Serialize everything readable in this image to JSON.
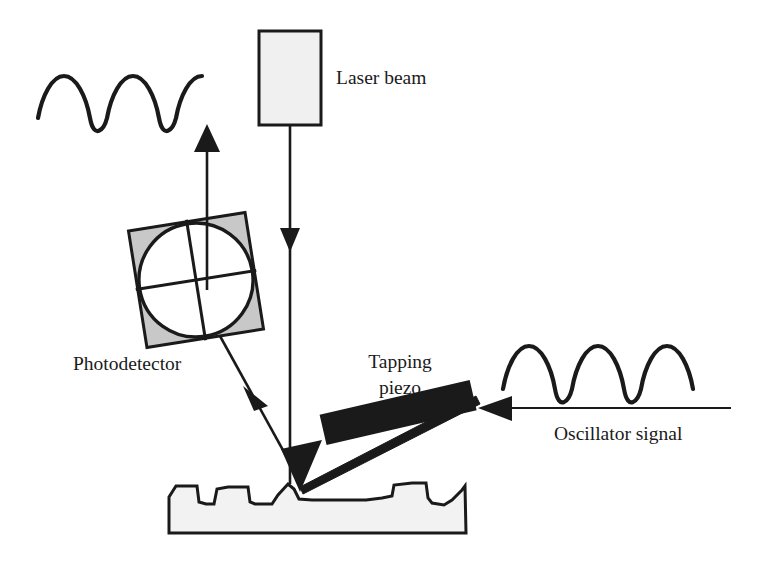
{
  "figure": {
    "background_color": "#ffffff",
    "ink_color": "#1a1a1a",
    "gray_fill": "#c8c8c8",
    "light_fill": "#f0f0f0",
    "sample_fill": "#f2f2f2"
  },
  "labels": {
    "laser_beam": "Laser beam",
    "photodetector": "Photodetector",
    "tapping_piezo_line1": "Tapping",
    "tapping_piezo_line2": "piezo",
    "oscillator_signal": "Oscillator signal"
  },
  "components": {
    "laser_box": {
      "name": "Laser beam source box",
      "x": 259,
      "y": 31,
      "width": 62,
      "height": 94,
      "fill": "#f0f0f0",
      "stroke": "#1a1a1a"
    },
    "photodetector": {
      "name": "Quadrant photodetector",
      "center_x": 196,
      "center_y": 280,
      "size": 118,
      "rotation_deg": -9,
      "fill": "#c8c8c8",
      "circle_fill": "#ffffff",
      "quadrants": 4
    },
    "tapping_piezo": {
      "name": "Tapping piezo element",
      "fill": "#1a1a1a",
      "rotation_deg": -13,
      "center_x": 398,
      "center_y": 415,
      "width": 152,
      "height": 29
    },
    "cantilever": {
      "name": "Cantilever beam",
      "tip_x": 300,
      "tip_y": 490,
      "base_x": 470,
      "base_y": 402
    },
    "tip": {
      "name": "Probe tip",
      "apex_x": 300,
      "apex_y": 492,
      "fill": "#1a1a1a"
    },
    "sample": {
      "name": "Sample surface with topography",
      "left_x": 168,
      "right_x": 466,
      "top_y": 484,
      "bottom_y": 536,
      "fill": "#f2f2f2"
    }
  },
  "signals": {
    "incident_beam": {
      "name": "Incident laser beam",
      "from_x": 290,
      "from_y": 125,
      "to_x": 290,
      "to_y": 482,
      "direction": "down",
      "arrow_at_y": 243
    },
    "reflected_beam": {
      "name": "Reflected beam to photodetector",
      "from_x": 298,
      "from_y": 480,
      "to_x": 200,
      "to_y": 300,
      "direction": "up-left",
      "arrow_at_x": 252,
      "arrow_at_y": 398
    },
    "detector_output": {
      "name": "Photodetector output arrow",
      "from_x": 207,
      "from_y": 288,
      "to_x": 207,
      "to_y": 132,
      "direction": "up"
    },
    "oscillator_input": {
      "name": "Oscillator signal line to piezo",
      "from_x": 728,
      "from_y": 408,
      "to_x": 472,
      "to_y": 408,
      "direction": "left"
    }
  },
  "waveforms": {
    "detector_signal": {
      "name": "Detector output waveform",
      "cycles": 4,
      "x_start": 38,
      "x_end": 178,
      "baseline_y": 102,
      "amplitude": 28
    },
    "oscillator_waveform": {
      "name": "Oscillator drive waveform",
      "cycles": 4,
      "x_start": 502,
      "x_end": 700,
      "baseline_y": 370,
      "amplitude": 28
    }
  }
}
